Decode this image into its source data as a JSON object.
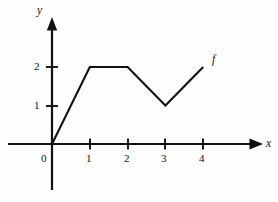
{
  "chart_data": {
    "type": "line",
    "title": "",
    "subtitle": "",
    "xlabel": "x",
    "ylabel": "y",
    "series": [
      {
        "name": "f",
        "x": [
          0,
          1,
          2,
          3,
          4
        ],
        "values": [
          0,
          2,
          2,
          1,
          2
        ]
      }
    ],
    "x_ticks": [
      "1",
      "2",
      "3",
      "4"
    ],
    "x_tick_values": [
      1,
      2,
      3,
      4
    ],
    "y_ticks": [
      "1",
      "2"
    ],
    "y_tick_values": [
      1,
      2
    ],
    "origin_label": "0",
    "xlim": [
      -0.45,
      5.6
    ],
    "ylim": [
      -1.2,
      3.3
    ],
    "grid": false,
    "legend": "none",
    "annotations": [
      {
        "text": "f",
        "x": 4.35,
        "y": 2.2
      }
    ],
    "colors": {
      "line": "#111111",
      "axis": "#111111",
      "background": "#fefefe"
    }
  },
  "labels": {
    "y_axis": "y",
    "x_axis": "x",
    "curve": "f",
    "origin": "0",
    "y_tick_2": "2",
    "y_tick_1": "1",
    "x_tick_1": "1",
    "x_tick_2": "2",
    "x_tick_3": "3",
    "x_tick_4": "4"
  }
}
